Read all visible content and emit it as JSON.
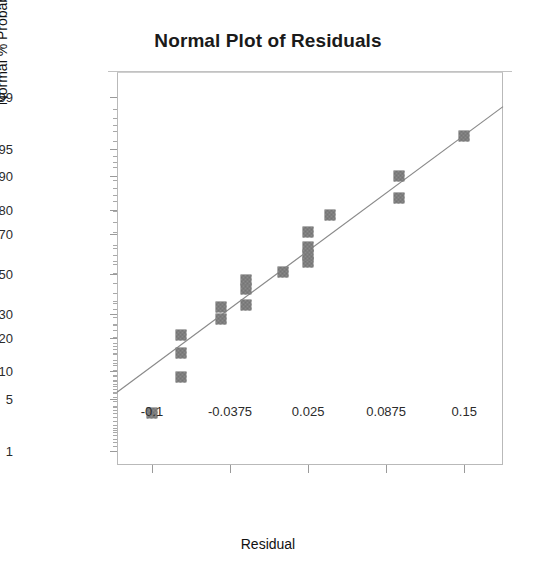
{
  "chart_data": {
    "type": "scatter",
    "title": "Normal Plot of Residuals",
    "xlabel": "Residual",
    "ylabel": "Normal % Probability",
    "grid": false,
    "legend": null,
    "xlim": [
      -0.128,
      0.181
    ],
    "xticks": [
      -0.1,
      -0.0375,
      0.025,
      0.0875,
      0.15
    ],
    "xtick_labels": [
      "-0.1",
      "-0.0375",
      "0.025",
      "0.0875",
      "0.15"
    ],
    "y_scale": "normal-probability",
    "ylim": [
      0.6,
      99.6
    ],
    "yticks": [
      1,
      5,
      10,
      20,
      30,
      50,
      70,
      80,
      90,
      95,
      99
    ],
    "ytick_labels": [
      "1",
      "5",
      "10",
      "20",
      "30",
      "50",
      "70",
      "80",
      "90",
      "95",
      "99"
    ],
    "y_minor_ticks": [
      2,
      3,
      7,
      15,
      25,
      40,
      60,
      75,
      85,
      93,
      97,
      98
    ],
    "marker_style": "filled-square-dithered",
    "marker_color": "#8a8a8a",
    "line_color": "#8a8a8a",
    "reference_line": {
      "x_start": -0.128,
      "y_start": 6.0,
      "x_end": 0.181,
      "y_end": 98.6
    },
    "points": [
      {
        "x": -0.1,
        "y": 3.4
      },
      {
        "x": -0.077,
        "y": 8.8
      },
      {
        "x": -0.077,
        "y": 15.0
      },
      {
        "x": -0.077,
        "y": 21.0
      },
      {
        "x": -0.0445,
        "y": 27.5
      },
      {
        "x": -0.0445,
        "y": 33.0
      },
      {
        "x": -0.0245,
        "y": 34.0
      },
      {
        "x": -0.0245,
        "y": 42.0
      },
      {
        "x": -0.0245,
        "y": 47.0
      },
      {
        "x": 0.0045,
        "y": 51.0
      },
      {
        "x": 0.025,
        "y": 56.0
      },
      {
        "x": 0.025,
        "y": 60.0
      },
      {
        "x": 0.025,
        "y": 64.0
      },
      {
        "x": 0.025,
        "y": 71.0
      },
      {
        "x": 0.0425,
        "y": 78.0
      },
      {
        "x": 0.098,
        "y": 84.0
      },
      {
        "x": 0.098,
        "y": 90.0
      },
      {
        "x": 0.15,
        "y": 96.5
      }
    ]
  }
}
